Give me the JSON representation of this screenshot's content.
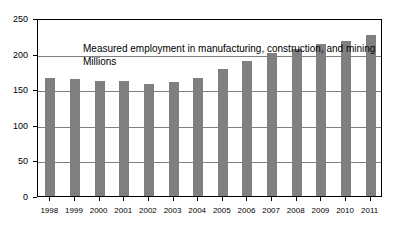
{
  "chart_data": {
    "type": "bar",
    "title": "Measured employment in manufacturing, construction, and mining",
    "subtitle": "Millions",
    "xlabel": "",
    "ylabel": "",
    "categories": [
      "1998",
      "1999",
      "2000",
      "2001",
      "2002",
      "2003",
      "2004",
      "2005",
      "2006",
      "2007",
      "2008",
      "2009",
      "2010",
      "2011"
    ],
    "values": [
      166,
      164,
      162,
      162,
      158,
      160,
      166,
      178,
      190,
      201,
      207,
      213,
      218,
      226
    ],
    "ylim": [
      0,
      250
    ],
    "yticks": [
      0,
      50,
      100,
      150,
      200,
      250
    ],
    "grid": true,
    "legend": "none",
    "bar_color": "#808080",
    "grid_color": "#808080",
    "axis_color": "#000000",
    "background": "#ffffff"
  }
}
